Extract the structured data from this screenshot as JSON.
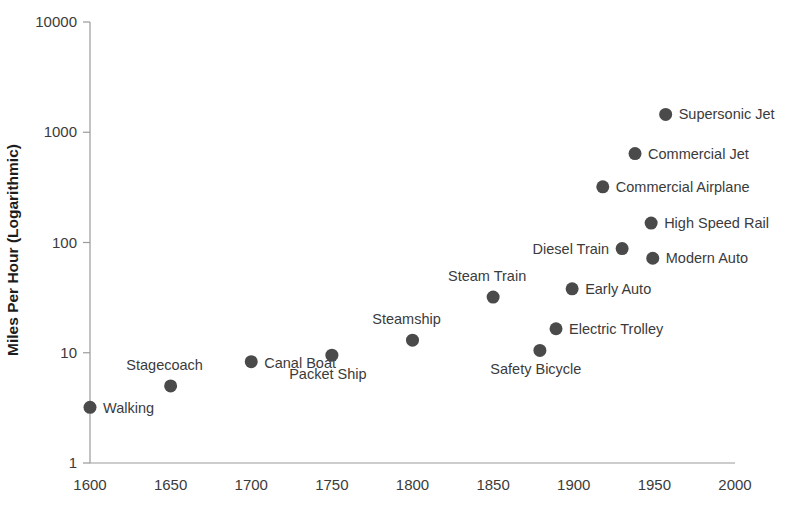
{
  "chart_data": {
    "type": "scatter",
    "title": "",
    "xlabel": "",
    "ylabel": "Miles Per Hour (Logarithmic)",
    "y_scale": "log",
    "ylim": [
      1,
      10000
    ],
    "xlim": [
      1600,
      2000
    ],
    "grid": false,
    "legend": "none",
    "y_ticks": [
      "10000",
      "1000",
      "100",
      "10",
      "1"
    ],
    "x_ticks": [
      "1600",
      "1650",
      "1700",
      "1750",
      "1800",
      "1850",
      "1900",
      "1950",
      "2000"
    ],
    "marker_color": "#4a4a4a",
    "axis_color": "#9a9a9a",
    "points": [
      {
        "label": "Walking",
        "x": 1600,
        "y": 3.2,
        "label_pos": "right-below"
      },
      {
        "label": "Stagecoach",
        "x": 1650,
        "y": 5.0,
        "label_pos": "left-above"
      },
      {
        "label": "Canal Boat",
        "x": 1700,
        "y": 8.3,
        "label_pos": "right-below"
      },
      {
        "label": "Packet Ship",
        "x": 1750,
        "y": 9.5,
        "label_pos": "left-below"
      },
      {
        "label": "Steamship",
        "x": 1800,
        "y": 13.0,
        "label_pos": "left-above"
      },
      {
        "label": "Steam Train",
        "x": 1850,
        "y": 32.0,
        "label_pos": "left-above"
      },
      {
        "label": "Safety Bicycle",
        "x": 1879,
        "y": 10.5,
        "label_pos": "left-below"
      },
      {
        "label": "Electric Trolley",
        "x": 1889,
        "y": 16.5,
        "label_pos": "right"
      },
      {
        "label": "Early Auto",
        "x": 1899,
        "y": 38.0,
        "label_pos": "right"
      },
      {
        "label": "Diesel Train",
        "x": 1930,
        "y": 88.0,
        "label_pos": "left"
      },
      {
        "label": "Modern Auto",
        "x": 1949,
        "y": 72.0,
        "label_pos": "right"
      },
      {
        "label": "High Speed Rail",
        "x": 1948,
        "y": 150.0,
        "label_pos": "right"
      },
      {
        "label": "Commercial Airplane",
        "x": 1918,
        "y": 320.0,
        "label_pos": "right"
      },
      {
        "label": "Commercial Jet",
        "x": 1938,
        "y": 640.0,
        "label_pos": "right"
      },
      {
        "label": "Supersonic Jet",
        "x": 1957,
        "y": 1450.0,
        "label_pos": "right"
      }
    ]
  }
}
